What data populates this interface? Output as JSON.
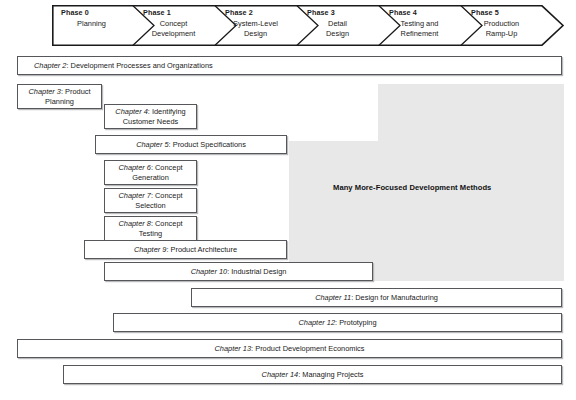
{
  "diagram": {
    "colors": {
      "gray_region": "#e8e8e8",
      "box_border": "#55575a",
      "box_shadow": "#b8b9bb",
      "text": "#1a1a1a"
    }
  },
  "phases": [
    {
      "number": "Phase 0",
      "name_line1": "Planning",
      "name_line2": ""
    },
    {
      "number": "Phase 1",
      "name_line1": "Concept",
      "name_line2": "Development"
    },
    {
      "number": "Phase 2",
      "name_line1": "System-Level",
      "name_line2": "Design"
    },
    {
      "number": "Phase 3",
      "name_line1": "Detail",
      "name_line2": "Design"
    },
    {
      "number": "Phase 4",
      "name_line1": "Testing and",
      "name_line2": "Refinement"
    },
    {
      "number": "Phase 5",
      "name_line1": "Production",
      "name_line2": "Ramp-Up"
    }
  ],
  "gray_region": {
    "label": "Many More-Focused Development Methods"
  },
  "chapters": [
    {
      "label": "Chapter 2",
      "title": "Development Processes and Organizations",
      "lines": 1
    },
    {
      "label": "Chapter 3",
      "title": "Product Planning",
      "lines": 2,
      "line1": "Product",
      "line2": "Planning"
    },
    {
      "label": "Chapter 4",
      "title": "Identifying Customer Needs",
      "lines": 2,
      "line1": "Identifying",
      "line2": "Customer Needs"
    },
    {
      "label": "Chapter 5",
      "title": "Product Specifications",
      "lines": 1
    },
    {
      "label": "Chapter 6",
      "title": "Concept Generation",
      "lines": 2,
      "line1": "Concept",
      "line2": "Generation"
    },
    {
      "label": "Chapter 7",
      "title": "Concept Selection",
      "lines": 2,
      "line1": "Concept",
      "line2": "Selection"
    },
    {
      "label": "Chapter 8",
      "title": "Concept Testing",
      "lines": 2,
      "line1": "Concept",
      "line2": "Testing"
    },
    {
      "label": "Chapter 9",
      "title": "Product Architecture",
      "lines": 1
    },
    {
      "label": "Chapter 10",
      "title": "Industrial Design",
      "lines": 1
    },
    {
      "label": "Chapter 11",
      "title": "Design for Manufacturing",
      "lines": 1
    },
    {
      "label": "Chapter 12",
      "title": "Prototyping",
      "lines": 1
    },
    {
      "label": "Chapter 13",
      "title": "Product Development Economics",
      "lines": 1
    },
    {
      "label": "Chapter 14",
      "title": "Managing Projects",
      "lines": 1
    }
  ]
}
